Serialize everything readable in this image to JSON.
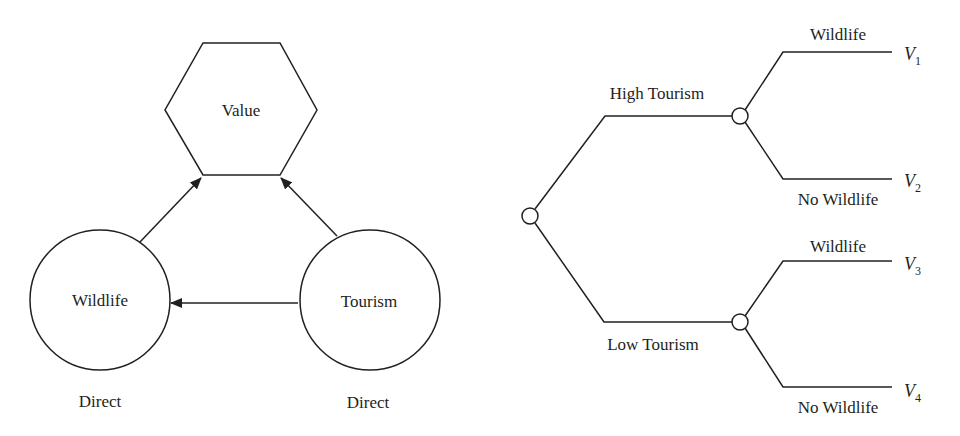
{
  "influence_diagram": {
    "value_node": {
      "label": "Value",
      "shape": "hexagon"
    },
    "chance_nodes": [
      {
        "id": "wildlife",
        "label": "Wildlife",
        "note": "Direct"
      },
      {
        "id": "tourism",
        "label": "Tourism",
        "note": "Direct"
      }
    ],
    "arcs": [
      {
        "from": "wildlife",
        "to": "value"
      },
      {
        "from": "tourism",
        "to": "value"
      },
      {
        "from": "tourism",
        "to": "wildlife"
      }
    ]
  },
  "decision_tree": {
    "branches": [
      {
        "label": "High Tourism",
        "outcomes": [
          {
            "label": "Wildlife",
            "value_var": "V",
            "sub": "1"
          },
          {
            "label": "No Wildlife",
            "value_var": "V",
            "sub": "2"
          }
        ]
      },
      {
        "label": "Low Tourism",
        "outcomes": [
          {
            "label": "Wildlife",
            "value_var": "V",
            "sub": "3"
          },
          {
            "label": "No Wildlife",
            "value_var": "V",
            "sub": "4"
          }
        ]
      }
    ]
  },
  "colors": {
    "stroke": "#231f20",
    "background": "#ffffff"
  }
}
